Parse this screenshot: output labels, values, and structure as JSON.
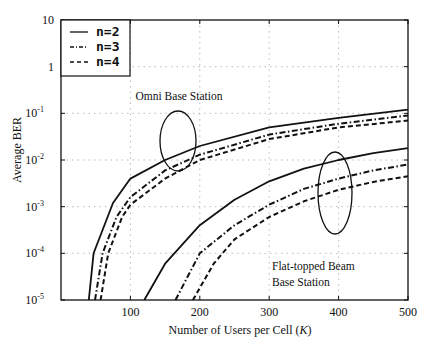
{
  "chart_data": {
    "type": "line",
    "title": "",
    "xlabel": "Number of Users per Cell (K)",
    "xlabel_parts": {
      "prefix": "Number of Users per Cell (",
      "var": "K",
      "suffix": ")"
    },
    "ylabel": "Average BER",
    "xlim": [
      0,
      500
    ],
    "ylim": [
      1e-05,
      10
    ],
    "yscale": "log",
    "grid": true,
    "x_ticks": [
      100,
      200,
      300,
      400,
      500
    ],
    "y_ticks": [
      {
        "value": 10,
        "base": "10",
        "exp": ""
      },
      {
        "value": 1,
        "base": "1",
        "exp": ""
      },
      {
        "value": 0.1,
        "base": "10",
        "exp": "-1"
      },
      {
        "value": 0.01,
        "base": "10",
        "exp": "-2"
      },
      {
        "value": 0.001,
        "base": "10",
        "exp": "-3"
      },
      {
        "value": 0.0001,
        "base": "10",
        "exp": "-4"
      },
      {
        "value": 1e-05,
        "base": "10",
        "exp": "-5"
      }
    ],
    "legend": {
      "position": "upper left",
      "entries": [
        {
          "label": "n=2",
          "style": "solid"
        },
        {
          "label": "n=3",
          "style": "dashdot"
        },
        {
          "label": "n=4",
          "style": "dashed"
        }
      ]
    },
    "annotations": [
      {
        "text": "Omni Base Station",
        "x": 170,
        "y_px": 100
      },
      {
        "text": "Flat-topped Beam",
        "x": 310,
        "y_px": 270
      },
      {
        "text": "Base Station",
        "x": 310,
        "y_px": 286
      }
    ],
    "series": [
      {
        "name": "Omni n=2",
        "group": "Omni Base Station",
        "n": 2,
        "style": "solid",
        "x": [
          40,
          47,
          75,
          100,
          150,
          200,
          300,
          400,
          500
        ],
        "y": [
          1e-05,
          0.0001,
          0.0012,
          0.004,
          0.01,
          0.02,
          0.05,
          0.08,
          0.12
        ]
      },
      {
        "name": "Omni n=3",
        "group": "Omni Base Station",
        "n": 3,
        "style": "dashdot",
        "x": [
          49,
          60,
          80,
          100,
          150,
          200,
          300,
          400,
          500
        ],
        "y": [
          1e-05,
          0.0001,
          0.0006,
          0.0016,
          0.006,
          0.013,
          0.035,
          0.06,
          0.09
        ]
      },
      {
        "name": "Omni n=4",
        "group": "Omni Base Station",
        "n": 4,
        "style": "dashed",
        "x": [
          57,
          68,
          88,
          100,
          150,
          200,
          300,
          400,
          500
        ],
        "y": [
          1e-05,
          0.0001,
          0.0006,
          0.0011,
          0.004,
          0.01,
          0.028,
          0.05,
          0.07
        ]
      },
      {
        "name": "Flat-topped n=2",
        "group": "Flat-topped Beam Base Station",
        "n": 2,
        "style": "solid",
        "x": [
          120,
          150,
          200,
          250,
          300,
          350,
          400,
          450,
          500
        ],
        "y": [
          1e-05,
          6e-05,
          0.0004,
          0.0014,
          0.0035,
          0.0065,
          0.01,
          0.014,
          0.018
        ]
      },
      {
        "name": "Flat-topped n=3",
        "group": "Flat-topped Beam Base Station",
        "n": 3,
        "style": "dashdot",
        "x": [
          165,
          200,
          250,
          300,
          350,
          400,
          450,
          500
        ],
        "y": [
          1e-05,
          0.0001,
          0.0004,
          0.0011,
          0.0024,
          0.004,
          0.006,
          0.008
        ]
      },
      {
        "name": "Flat-topped n=4",
        "group": "Flat-topped Beam Base Station",
        "n": 4,
        "style": "dashed",
        "x": [
          190,
          220,
          250,
          300,
          350,
          400,
          450,
          500
        ],
        "y": [
          1e-05,
          6e-05,
          0.0002,
          0.0006,
          0.0013,
          0.0023,
          0.0034,
          0.0045
        ]
      }
    ],
    "ellipses": [
      {
        "name": "omni-ellipse",
        "cx": 178,
        "cy": 141,
        "rx": 18,
        "ry": 30
      },
      {
        "name": "flat-ellipse",
        "cx": 335,
        "cy": 193,
        "rx": 17,
        "ry": 41
      }
    ]
  }
}
